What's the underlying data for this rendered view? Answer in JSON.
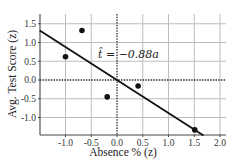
{
  "chart_data": {
    "type": "scatter",
    "title": "",
    "xlabel": "Absence % (z)",
    "ylabel": "Avg. Test Score (z)",
    "xlim": [
      -1.5,
      2.1
    ],
    "ylim": [
      -1.5,
      1.75
    ],
    "xticks": [
      "-1.0",
      "-0.5",
      "0.0",
      "0.5",
      "1.0",
      "1.5",
      "2.0"
    ],
    "yticks": [
      "1.5",
      "1.0",
      "0.5",
      "0.0",
      "-0.5",
      "-1.0"
    ],
    "grid": true,
    "points": [
      {
        "x": -1.0,
        "y": 0.62
      },
      {
        "x": -0.68,
        "y": 1.32
      },
      {
        "x": -0.19,
        "y": -0.45
      },
      {
        "x": 0.41,
        "y": -0.16
      },
      {
        "x": 1.51,
        "y": -1.33
      }
    ],
    "fit_line": {
      "slope": -0.88,
      "intercept": 0.0,
      "x_start": -1.5,
      "x_end": 1.68
    },
    "annotation": "t̂ = −0.88a",
    "legend": null
  }
}
